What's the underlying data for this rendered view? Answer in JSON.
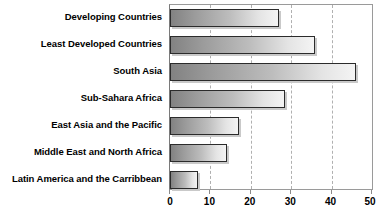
{
  "chart_data": {
    "type": "bar",
    "orientation": "horizontal",
    "title": "",
    "subtitle": "",
    "xlabel": "",
    "ylabel": "",
    "xlim": [
      0,
      50
    ],
    "xticks": [
      0,
      10,
      20,
      30,
      40,
      50
    ],
    "xtick_labels": [
      "0",
      "10",
      "20",
      "30",
      "40",
      "50"
    ],
    "grid": true,
    "grid_axis": "x",
    "grid_style": "dashed",
    "legend": false,
    "legend_position": "none",
    "categories": [
      "Developing Countries",
      "Least Developed Countries",
      "South Asia",
      "Sub-Sahara Africa",
      "East Asia and the Pacific",
      "Middle East and North Africa",
      "Latin America and the Carribbean"
    ],
    "values": [
      27,
      36,
      46,
      28.5,
      17,
      14,
      7
    ],
    "series": [
      {
        "name": "",
        "values": [
          27,
          36,
          46,
          28.5,
          17,
          14,
          7
        ]
      }
    ],
    "colors": {
      "bar_gradient_start": "#828282",
      "bar_gradient_end": "#f4f4f4",
      "bar_border": "#2b2b2b",
      "bar_shadow": "#c9c9c9",
      "gridline": "#b0b0b0",
      "axis_border": "#9a9a9a",
      "label_text": "#000000",
      "background": "#ffffff"
    }
  }
}
